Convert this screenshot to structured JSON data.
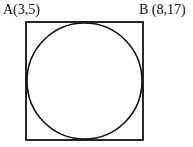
{
  "figure": {
    "background_color": "#ffffff",
    "stroke_color": "#111111",
    "labels": {
      "top_left": "A(3,5)",
      "top_right": "B (8,17)"
    },
    "shapes": {
      "square": {
        "name": "square",
        "x": 26,
        "y": 22,
        "width": 117,
        "height": 118,
        "stroke_width": 1.8,
        "fill": "none"
      },
      "circle": {
        "name": "inscribed-circle",
        "cx": 84.5,
        "cy": 81,
        "rx": 57.5,
        "ry": 58,
        "stroke_width": 1.6,
        "fill": "none"
      }
    }
  }
}
